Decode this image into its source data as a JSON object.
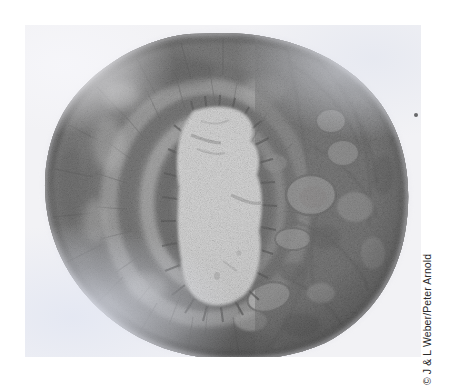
{
  "figure": {
    "type": "photomicrograph",
    "credit": "© J & L Weber/Peter Arnold",
    "background_color": "#ffffff",
    "plate_color": "#f2f2f5"
  },
  "photo": {
    "left": 25,
    "top": 25,
    "width": 396,
    "height": 332,
    "stain_tone": "grayscale",
    "artifacts": [
      {
        "name": "dust-speck",
        "x": 389,
        "y": 88,
        "size": 4,
        "color": "#4a4a4a"
      }
    ]
  },
  "specimen": {
    "outline": "irregular rounded mass filling most of the plate",
    "center_x": 198,
    "center_y": 160,
    "layers": [
      {
        "name": "outer-adventitia",
        "tone": "#6d6d6d",
        "description": "dark granular outer rim"
      },
      {
        "name": "muscularis-outer",
        "tone": "#7d7d7d",
        "description": "dense fibrous band"
      },
      {
        "name": "muscularis-inner",
        "tone": "#9a9a9a",
        "description": "lighter concentric band"
      },
      {
        "name": "submucosa",
        "tone": "#b5b5b5",
        "description": "pale ring next to the lumen"
      },
      {
        "name": "mucosa-epithelium",
        "tone": "#5e5e5e",
        "description": "dark fringed inner lining"
      },
      {
        "name": "lumen",
        "tone": "#fbfbfb",
        "description": "bright irregular central cavity"
      }
    ],
    "accessory_structures": [
      {
        "name": "vessel-lumen",
        "x": 284,
        "y": 168,
        "rx": 22,
        "ry": 17
      },
      {
        "name": "vessel-lumen",
        "x": 318,
        "y": 128,
        "rx": 15,
        "ry": 12
      },
      {
        "name": "vessel-lumen",
        "x": 268,
        "y": 214,
        "rx": 17,
        "ry": 10
      },
      {
        "name": "vessel-lumen",
        "x": 240,
        "y": 276,
        "rx": 21,
        "ry": 14
      },
      {
        "name": "nerve-bundle",
        "x": 306,
        "y": 96,
        "rx": 14,
        "ry": 11
      }
    ]
  }
}
